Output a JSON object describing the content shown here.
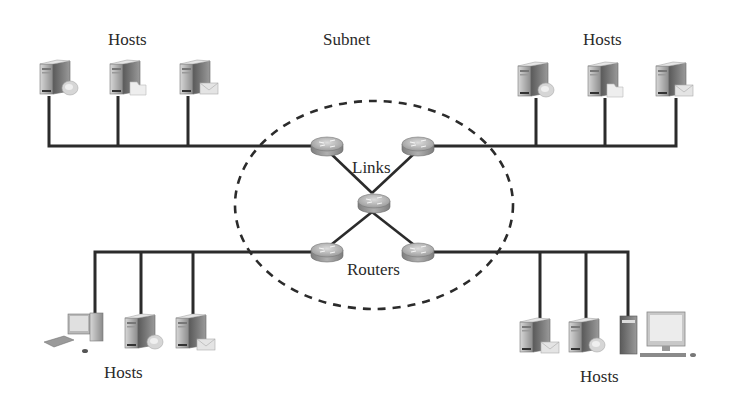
{
  "diagram": {
    "title_label": "Subnet",
    "links_label": "Links",
    "routers_label": "Routers",
    "host_groups": [
      {
        "position": "top-left",
        "label": "Hosts",
        "devices": [
          "server-with-disk",
          "server-with-folder",
          "server-with-mail"
        ]
      },
      {
        "position": "top-right",
        "label": "Hosts",
        "devices": [
          "server-with-disk",
          "server-with-folder",
          "server-with-mail"
        ]
      },
      {
        "position": "bottom-left",
        "label": "Hosts",
        "devices": [
          "desktop-pc",
          "server-with-disk",
          "server-with-mail"
        ]
      },
      {
        "position": "bottom-right",
        "label": "Hosts",
        "devices": [
          "server-with-mail",
          "server-with-disk",
          "tower-pc",
          "monitor-with-keyboard"
        ]
      }
    ],
    "routers": [
      {
        "id": "router-top-left"
      },
      {
        "id": "router-top-right"
      },
      {
        "id": "router-center"
      },
      {
        "id": "router-bottom-left"
      },
      {
        "id": "router-bottom-right"
      }
    ],
    "colors": {
      "line": "#2b2b2b",
      "dashed_boundary": "#2b2b2b",
      "router": "#9a9a9a",
      "text": "#2a2a2a"
    }
  }
}
